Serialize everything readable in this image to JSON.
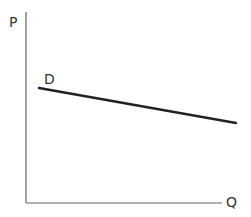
{
  "diagram": {
    "axes": {
      "y_label": "P",
      "x_label": "Q"
    },
    "curve": {
      "label": "D",
      "type": "linear, downward sloping",
      "color": "#222222"
    },
    "colors": {
      "axis": "#555555",
      "background": "#ffffff"
    }
  }
}
